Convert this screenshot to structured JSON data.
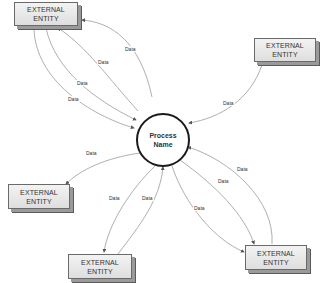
{
  "diagram": {
    "type": "data-flow-diagram",
    "process": {
      "line1": "Process",
      "line2": "Name"
    },
    "entities": [
      {
        "id": "top-left",
        "line1": "EXTERNAL",
        "line2": "ENTITY"
      },
      {
        "id": "top-right",
        "line1": "EXTERNAL",
        "line2": "ENTITY"
      },
      {
        "id": "mid-left",
        "line1": "EXTERNAL",
        "line2": "ENTITY"
      },
      {
        "id": "bottom-center",
        "line1": "EXTERNAL",
        "line2": "ENTITY"
      },
      {
        "id": "bottom-right",
        "line1": "EXTERNAL",
        "line2": "ENTITY"
      }
    ],
    "flows": [
      {
        "from": "process",
        "to": "top-left",
        "label": "Data"
      },
      {
        "from": "process",
        "to": "top-left",
        "label": "Data"
      },
      {
        "from": "top-left",
        "to": "process",
        "label": "Data"
      },
      {
        "from": "top-left",
        "to": "process",
        "label": "Data"
      },
      {
        "from": "top-right",
        "to": "process",
        "label": "Data"
      },
      {
        "from": "process",
        "to": "mid-left",
        "label": "Data"
      },
      {
        "from": "process",
        "to": "bottom-center",
        "label": "Data"
      },
      {
        "from": "bottom-center",
        "to": "process",
        "label": "Data"
      },
      {
        "from": "process",
        "to": "bottom-right",
        "label": "Data"
      },
      {
        "from": "process",
        "to": "bottom-right",
        "label": "Data"
      },
      {
        "from": "bottom-right",
        "to": "process",
        "label": "Data"
      }
    ]
  }
}
